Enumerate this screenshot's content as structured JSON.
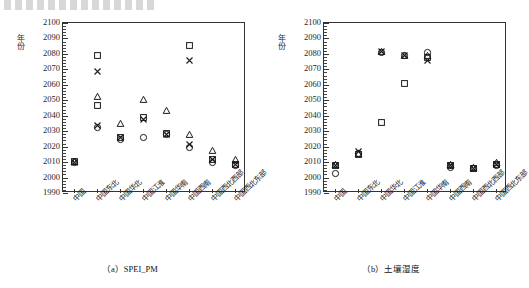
{
  "figure": {
    "ylabel": "年份",
    "ytick_labels": [
      "2100",
      "2090",
      "2080",
      "2070",
      "2060",
      "2050",
      "2040",
      "2030",
      "2020",
      "2010",
      "2000",
      "1990"
    ],
    "ylim": [
      1990,
      2100
    ],
    "ystep": 10,
    "yminor_step": 2,
    "categories": [
      "中国",
      "中国东北",
      "中国华北",
      "中国江淮",
      "中国华南",
      "中国西南",
      "中国西北西部",
      "中国西北东部"
    ],
    "marker_names": [
      "circle",
      "square",
      "triangle",
      "cross"
    ],
    "colors": {
      "axis": "#333333",
      "marker": "#1a1a1a",
      "background": "#ffffff"
    }
  },
  "panels": [
    {
      "id": "a",
      "caption": "（a）SPEI_PM",
      "chart_data": {
        "type": "scatter",
        "title": "（a）SPEI_PM",
        "xlabel": "",
        "ylabel": "年份",
        "ylim": [
          1990,
          2100
        ],
        "grid": false,
        "legend": "none",
        "categories": [
          "中国",
          "中国东北",
          "中国华北",
          "中国江淮",
          "中国华南",
          "中国西南",
          "中国西北西部",
          "中国西北东部"
        ],
        "series": [
          {
            "name": "circle",
            "values": [
              2010,
              2033,
              2025,
              2026,
              2028,
              2020,
              2010,
              2008
            ]
          },
          {
            "name": "square",
            "values": [
              2011,
              2047,
              2026,
              2039,
              2029,
              2086,
              2012,
              2009
            ]
          },
          {
            "name": "triangle",
            "values": [
              2011,
              2053,
              2035,
              2051,
              2044,
              2028,
              2018,
              2012
            ]
          },
          {
            "name": "cross",
            "values": [
              2010,
              2034,
              2026,
              2038,
              2028,
              2022,
              2012,
              2009
            ]
          }
        ],
        "extra_points": [
          {
            "category": "中国东北",
            "marker": "square",
            "value": 2079
          },
          {
            "category": "中国东北",
            "marker": "cross",
            "value": 2069
          },
          {
            "category": "中国西南",
            "marker": "cross",
            "value": 2076
          }
        ]
      }
    },
    {
      "id": "b",
      "caption": "（b）土壤湿度",
      "chart_data": {
        "type": "scatter",
        "title": "（b）土壤湿度",
        "xlabel": "",
        "ylabel": "年份",
        "ylim": [
          1990,
          2100
        ],
        "grid": false,
        "legend": "none",
        "categories": [
          "中国",
          "中国东北",
          "中国华北",
          "中国江淮",
          "中国华南",
          "中国西南",
          "中国西北西部",
          "中国西北东部"
        ],
        "series": [
          {
            "name": "circle",
            "values": [
              2003,
              2016,
              2081,
              2079,
              2081,
              2007,
              2006,
              2008
            ]
          },
          {
            "name": "square",
            "values": [
              2008,
              2015,
              2036,
              2061,
              2078,
              2008,
              2006,
              2009
            ]
          },
          {
            "name": "triangle",
            "values": [
              2009,
              2016,
              2082,
              2079,
              2079,
              2009,
              2007,
              2010
            ]
          },
          {
            "name": "cross",
            "values": [
              2008,
              2017,
              2082,
              2079,
              2076,
              2008,
              2006,
              2009
            ]
          }
        ],
        "extra_points": []
      }
    }
  ]
}
